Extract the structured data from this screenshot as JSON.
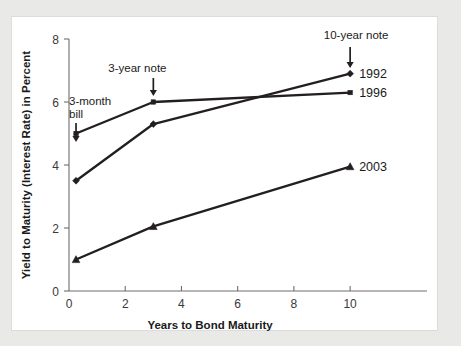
{
  "chart_data": {
    "type": "line",
    "title": "",
    "xlabel": "Years to Bond Maturity",
    "ylabel": "Yield to Maturity (Interest Rate) in Percent",
    "xlim": [
      0,
      10.6
    ],
    "ylim": [
      0,
      8
    ],
    "xticks": [
      0,
      2,
      4,
      6,
      8,
      10
    ],
    "xticklabels": [
      "0",
      "2",
      "4",
      "6",
      "8",
      "10"
    ],
    "yticks": [
      0,
      2,
      4,
      6,
      8
    ],
    "yticklabels": [
      "0",
      "2",
      "4",
      "6",
      "8"
    ],
    "grid": false,
    "legend_position": "right-of-line-ends",
    "x": [
      0.25,
      3,
      10
    ],
    "x_point_names": [
      "3-month bill",
      "3-year note",
      "10-year note"
    ],
    "series": [
      {
        "name": "1992",
        "marker": "diamond",
        "color": "#231f20",
        "values": [
          3.5,
          5.3,
          6.9
        ]
      },
      {
        "name": "1996",
        "marker": "square",
        "color": "#231f20",
        "values": [
          5.0,
          6.0,
          6.3
        ]
      },
      {
        "name": "2003",
        "marker": "triangle",
        "color": "#231f20",
        "values": [
          1.0,
          2.05,
          3.95
        ]
      }
    ],
    "annotations": [
      {
        "id": "three-month-bill",
        "line1": "3-month",
        "line2": "bill",
        "points_to_x": 0.25
      },
      {
        "id": "three-year-note",
        "line1": "3-year note",
        "line2": "",
        "points_to_x": 3
      },
      {
        "id": "ten-year-note",
        "line1": "10-year note",
        "line2": "",
        "points_to_x": 10
      }
    ]
  },
  "colors": {
    "page_background": "#e9e9e7",
    "panel_background": "#ffffff",
    "ink": "#231f20",
    "axis": "#6e6e6e"
  }
}
